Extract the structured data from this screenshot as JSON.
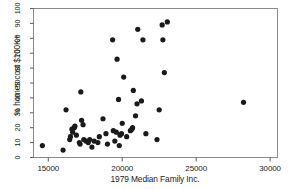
{
  "chart_data": {
    "type": "scatter",
    "title": "",
    "xlabel": "1979 Median Family Inc.",
    "ylabel": "% homes cost $100K+",
    "xlim": [
      14000,
      30500
    ],
    "ylim": [
      0,
      100
    ],
    "xticks": [
      15000,
      20000,
      25000,
      30000
    ],
    "xtick_labels": [
      "15000",
      "20000",
      "25000",
      "30000"
    ],
    "yticks": [
      0,
      10,
      20,
      30,
      40,
      50,
      60,
      70,
      80,
      90,
      100
    ],
    "ytick_labels": [
      "0",
      "10",
      "20",
      "30",
      "40",
      "50",
      "60",
      "70",
      "80",
      "90",
      "100"
    ],
    "grid": false,
    "legend": null,
    "marker": {
      "shape": "circle",
      "color": "#1a1a1a",
      "size_px": 5.2
    },
    "frame_color": "#8a8a8a",
    "points": [
      {
        "x": 14600,
        "y": 8
      },
      {
        "x": 16000,
        "y": 5
      },
      {
        "x": 16200,
        "y": 32
      },
      {
        "x": 16450,
        "y": 12
      },
      {
        "x": 16500,
        "y": 14
      },
      {
        "x": 16600,
        "y": 19
      },
      {
        "x": 16650,
        "y": 17
      },
      {
        "x": 16750,
        "y": 20
      },
      {
        "x": 16800,
        "y": 21
      },
      {
        "x": 16900,
        "y": 15
      },
      {
        "x": 17100,
        "y": 10
      },
      {
        "x": 17150,
        "y": 9
      },
      {
        "x": 17200,
        "y": 44
      },
      {
        "x": 17250,
        "y": 25
      },
      {
        "x": 17350,
        "y": 22
      },
      {
        "x": 17400,
        "y": 12
      },
      {
        "x": 17550,
        "y": 11
      },
      {
        "x": 17700,
        "y": 10
      },
      {
        "x": 17800,
        "y": 12
      },
      {
        "x": 17950,
        "y": 7
      },
      {
        "x": 18100,
        "y": 11
      },
      {
        "x": 18350,
        "y": 10
      },
      {
        "x": 18450,
        "y": 14
      },
      {
        "x": 18700,
        "y": 26
      },
      {
        "x": 18900,
        "y": 16
      },
      {
        "x": 19000,
        "y": 9
      },
      {
        "x": 19350,
        "y": 79
      },
      {
        "x": 19400,
        "y": 18
      },
      {
        "x": 19500,
        "y": 11
      },
      {
        "x": 19600,
        "y": 17
      },
      {
        "x": 19650,
        "y": 66
      },
      {
        "x": 19750,
        "y": 39
      },
      {
        "x": 19800,
        "y": 8
      },
      {
        "x": 19850,
        "y": 15
      },
      {
        "x": 19950,
        "y": 16
      },
      {
        "x": 20000,
        "y": 23
      },
      {
        "x": 20100,
        "y": 54
      },
      {
        "x": 20300,
        "y": 14
      },
      {
        "x": 20550,
        "y": 18
      },
      {
        "x": 20650,
        "y": 19
      },
      {
        "x": 20700,
        "y": 20
      },
      {
        "x": 20750,
        "y": 45
      },
      {
        "x": 20900,
        "y": 28
      },
      {
        "x": 21000,
        "y": 36
      },
      {
        "x": 21050,
        "y": 86
      },
      {
        "x": 21300,
        "y": 38
      },
      {
        "x": 21400,
        "y": 79
      },
      {
        "x": 21600,
        "y": 16
      },
      {
        "x": 22350,
        "y": 12
      },
      {
        "x": 22500,
        "y": 32
      },
      {
        "x": 22700,
        "y": 89
      },
      {
        "x": 22750,
        "y": 79
      },
      {
        "x": 22850,
        "y": 57
      },
      {
        "x": 23050,
        "y": 91
      },
      {
        "x": 28200,
        "y": 37
      }
    ]
  }
}
